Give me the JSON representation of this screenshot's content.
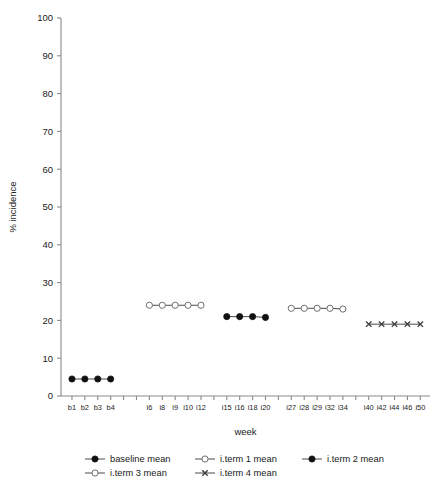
{
  "chart_data": {
    "type": "line",
    "title": "",
    "xlabel": "week",
    "ylabel": "% incidence",
    "ylim": [
      0,
      100
    ],
    "ytick_labels": [
      "0",
      "10",
      "20",
      "30",
      "40",
      "50",
      "60",
      "70",
      "80",
      "90",
      "100"
    ],
    "ytick_values": [
      0,
      10,
      20,
      30,
      40,
      50,
      60,
      70,
      80,
      90,
      100
    ],
    "grid": false,
    "legend_position": "bottom",
    "x_categories": [
      "b1",
      "b2",
      "b3",
      "b4",
      "",
      "",
      "i6",
      "i8",
      "i9",
      "i10",
      "i12",
      "",
      "i15",
      "i16",
      "i18",
      "i20",
      "",
      "i27",
      "i28",
      "i29",
      "i32",
      "i34",
      "",
      "i40",
      "i42",
      "i44",
      "i46",
      "i50"
    ],
    "x_tick_labels": [
      "b1",
      "b2",
      "b3",
      "b4",
      "i6",
      "i8",
      "i9",
      "i10",
      "i12",
      "i15",
      "i16",
      "i18",
      "i20",
      "i27",
      "i28",
      "i29",
      "i32",
      "i34",
      "i40",
      "i42",
      "i44",
      "i46",
      "i50"
    ],
    "series": [
      {
        "name": "baseline mean",
        "marker": "filled-circle",
        "x_labels": [
          "b1",
          "b2",
          "b3",
          "b4"
        ],
        "x_index": [
          0,
          1,
          2,
          3
        ],
        "values": [
          4.5,
          4.5,
          4.5,
          4.5
        ]
      },
      {
        "name": "i.term 1 mean",
        "marker": "open-circle",
        "x_labels": [
          "i6",
          "i8",
          "i9",
          "i10",
          "i12"
        ],
        "x_index": [
          6,
          7,
          8,
          9,
          10
        ],
        "values": [
          24.0,
          24.0,
          24.0,
          24.0,
          24.0
        ]
      },
      {
        "name": "i.term 2 mean",
        "marker": "filled-circle",
        "x_labels": [
          "i15",
          "i16",
          "i18",
          "i20"
        ],
        "x_index": [
          12,
          13,
          14,
          15
        ],
        "values": [
          21.0,
          21.0,
          21.0,
          20.8
        ]
      },
      {
        "name": "i.term 3 mean",
        "marker": "open-circle",
        "x_labels": [
          "i27",
          "i28",
          "i29",
          "i32",
          "i34"
        ],
        "x_index": [
          17,
          18,
          19,
          20,
          21
        ],
        "values": [
          23.2,
          23.2,
          23.2,
          23.2,
          23.0
        ]
      },
      {
        "name": "i.term 4 mean",
        "marker": "cross",
        "x_labels": [
          "i40",
          "i42",
          "i44",
          "i46",
          "i50"
        ],
        "x_index": [
          23,
          24,
          25,
          26,
          27
        ],
        "values": [
          19.0,
          19.0,
          19.0,
          19.0,
          19.0
        ]
      }
    ]
  },
  "legend": {
    "items": [
      {
        "label": "baseline mean",
        "marker": "filled-circle"
      },
      {
        "label": "i.term 1 mean",
        "marker": "open-circle"
      },
      {
        "label": "i.term 2 mean",
        "marker": "filled-circle"
      },
      {
        "label": "i.term 3 mean",
        "marker": "open-circle"
      },
      {
        "label": "i.term 4 mean",
        "marker": "cross"
      }
    ]
  },
  "colors": {
    "axis": "#8a8a8a",
    "line": "#4a4a4a",
    "marker_fill": "#111111",
    "marker_open_fill": "#ffffff",
    "text": "#1a1a1a",
    "background": "#ffffff"
  }
}
